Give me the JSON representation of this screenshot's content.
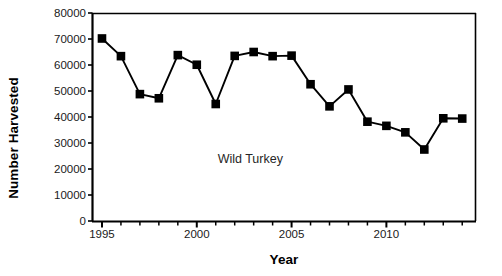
{
  "chart_data": {
    "type": "line",
    "title": "",
    "annotation": "Wild Turkey",
    "xlabel": "Year",
    "ylabel": "Number Harvested",
    "xlim": [
      1994.5,
      2014.7
    ],
    "ylim": [
      0,
      80000
    ],
    "grid": false,
    "legend": null,
    "marker": "square",
    "marker_color": "#000000",
    "line_color": "#000000",
    "x": [
      1995,
      1996,
      1997,
      1998,
      1999,
      2000,
      2001,
      2002,
      2003,
      2004,
      2005,
      2006,
      2007,
      2008,
      2009,
      2010,
      2011,
      2012,
      2013,
      2014
    ],
    "values": [
      70200,
      63400,
      48800,
      47200,
      63800,
      60100,
      45000,
      63500,
      65000,
      63400,
      63600,
      52600,
      44100,
      50600,
      38200,
      36600,
      34100,
      27500,
      39500,
      39400
    ],
    "series": [
      {
        "name": "Wild Turkey",
        "values": [
          70200,
          63400,
          48800,
          47200,
          63800,
          60100,
          45000,
          63500,
          65000,
          63400,
          63600,
          52600,
          44100,
          50600,
          38200,
          36600,
          34100,
          27500,
          39500,
          39400
        ]
      }
    ],
    "ytick_labels": [
      "80000",
      "70000",
      "60000",
      "50000",
      "40000",
      "30000",
      "20000",
      "10000",
      "0"
    ],
    "ytick_values": [
      80000,
      70000,
      60000,
      50000,
      40000,
      30000,
      20000,
      10000,
      0
    ],
    "xtick_labels": [
      "1995",
      "2000",
      "2005",
      "2010"
    ],
    "xtick_values": [
      1995,
      2000,
      2005,
      2010
    ],
    "xminor_step": 1
  }
}
